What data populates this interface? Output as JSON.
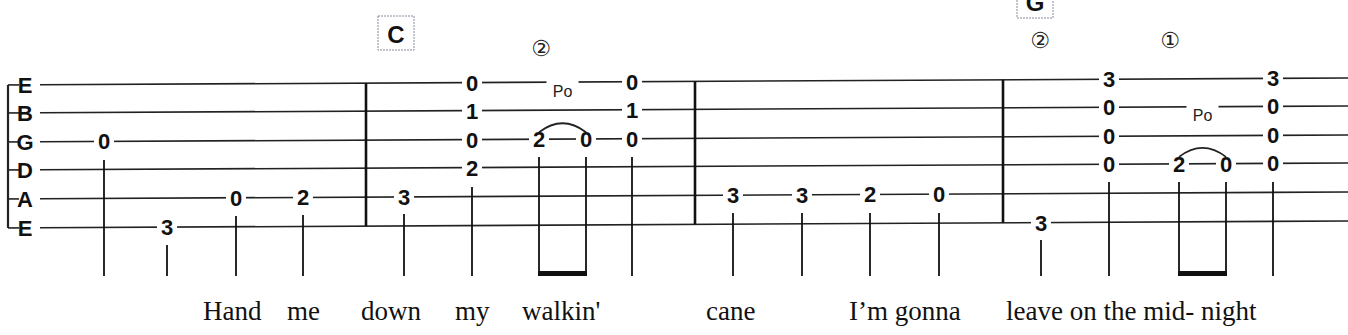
{
  "strings": [
    "E",
    "B",
    "G",
    "D",
    "A",
    "E"
  ],
  "string_y_left": [
    85,
    113,
    142,
    170,
    199,
    228
  ],
  "string_y_right": [
    78,
    106,
    135,
    163,
    192,
    221
  ],
  "staff": {
    "x_start": 14,
    "x_end": 1348
  },
  "barlines": [
    366,
    695,
    1003
  ],
  "chords": [
    {
      "label": "C",
      "x": 396,
      "y": 16,
      "w": 36,
      "h": 34
    },
    {
      "label": "G",
      "x": 1035,
      "y": -14,
      "w": 36,
      "h": 32
    }
  ],
  "string_markers": [
    {
      "label": "②",
      "x": 541,
      "y": 48
    },
    {
      "label": "②",
      "x": 1040,
      "y": 40
    },
    {
      "label": "①",
      "x": 1170,
      "y": 40
    }
  ],
  "notes": [
    {
      "x": 104,
      "frets": [
        {
          "string": 2,
          "fret": "0"
        }
      ],
      "stem_top": 160
    },
    {
      "x": 167,
      "frets": [
        {
          "string": 5,
          "fret": "3"
        }
      ],
      "stem_top": 245
    },
    {
      "x": 236,
      "frets": [
        {
          "string": 4,
          "fret": "0"
        }
      ],
      "stem_top": 216
    },
    {
      "x": 303,
      "frets": [
        {
          "string": 4,
          "fret": "2"
        }
      ],
      "stem_top": 215
    },
    {
      "x": 404,
      "frets": [
        {
          "string": 4,
          "fret": "3"
        }
      ],
      "stem_top": 214
    },
    {
      "x": 472,
      "frets": [
        {
          "string": 0,
          "fret": "0"
        },
        {
          "string": 1,
          "fret": "1"
        },
        {
          "string": 2,
          "fret": "0"
        },
        {
          "string": 3,
          "fret": "2"
        }
      ],
      "stem_top": 187
    },
    {
      "x": 539,
      "frets": [
        {
          "string": 2,
          "fret": "2"
        }
      ],
      "stem_top": 157
    },
    {
      "x": 586,
      "frets": [
        {
          "string": 2,
          "fret": "0"
        }
      ],
      "stem_top": 157
    },
    {
      "x": 632,
      "frets": [
        {
          "string": 0,
          "fret": "0"
        },
        {
          "string": 1,
          "fret": "1"
        },
        {
          "string": 2,
          "fret": "0"
        }
      ],
      "stem_top": 157
    },
    {
      "x": 733,
      "frets": [
        {
          "string": 4,
          "fret": "3"
        }
      ],
      "stem_top": 213
    },
    {
      "x": 802,
      "frets": [
        {
          "string": 4,
          "fret": "3"
        }
      ],
      "stem_top": 213
    },
    {
      "x": 870,
      "frets": [
        {
          "string": 4,
          "fret": "2"
        }
      ],
      "stem_top": 213
    },
    {
      "x": 939,
      "frets": [
        {
          "string": 4,
          "fret": "0"
        }
      ],
      "stem_top": 213
    },
    {
      "x": 1041,
      "frets": [
        {
          "string": 5,
          "fret": "3"
        }
      ],
      "stem_top": 240
    },
    {
      "x": 1109,
      "frets": [
        {
          "string": 0,
          "fret": "3"
        },
        {
          "string": 1,
          "fret": "0"
        },
        {
          "string": 2,
          "fret": "0"
        },
        {
          "string": 3,
          "fret": "0"
        }
      ],
      "stem_top": 182
    },
    {
      "x": 1179,
      "frets": [
        {
          "string": 3,
          "fret": "2"
        }
      ],
      "stem_top": 182
    },
    {
      "x": 1226,
      "frets": [
        {
          "string": 3,
          "fret": "0"
        }
      ],
      "stem_top": 182
    },
    {
      "x": 1273,
      "frets": [
        {
          "string": 0,
          "fret": "3"
        },
        {
          "string": 1,
          "fret": "0"
        },
        {
          "string": 2,
          "fret": "0"
        },
        {
          "string": 3,
          "fret": "0"
        }
      ],
      "stem_top": 182
    }
  ],
  "stem_bottom": 276,
  "beams": [
    {
      "x1": 539,
      "x2": 586
    },
    {
      "x1": 1179,
      "x2": 1226
    }
  ],
  "pulloffs": [
    {
      "label": "Po",
      "x1": 539,
      "x2": 586,
      "string": 2,
      "label_y": 97
    },
    {
      "label": "Po",
      "x1": 1179,
      "x2": 1226,
      "string": 3,
      "label_y": 121
    }
  ],
  "lyrics": [
    {
      "text": "Hand",
      "x": 203
    },
    {
      "text": "me",
      "x": 287
    },
    {
      "text": "down",
      "x": 361
    },
    {
      "text": "my",
      "x": 455
    },
    {
      "text": "walkin'",
      "x": 522
    },
    {
      "text": "cane",
      "x": 706
    },
    {
      "text": "I’m gonna",
      "x": 849
    },
    {
      "text": "leave on the mid- night",
      "x": 1006
    }
  ],
  "lyric_y": 320
}
